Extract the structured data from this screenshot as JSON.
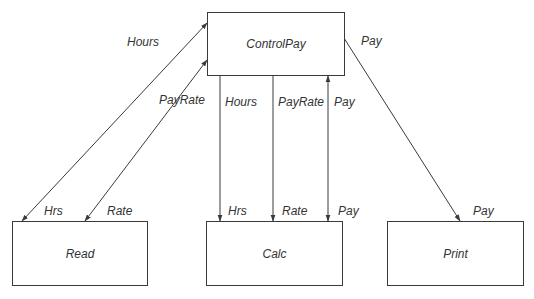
{
  "nodes": {
    "controlpay": {
      "label": "ControlPay"
    },
    "read": {
      "label": "Read"
    },
    "calc": {
      "label": "Calc"
    },
    "print": {
      "label": "Print"
    }
  },
  "edges": [
    {
      "from": "ControlPay",
      "to": "Read",
      "direction": "bidirectional",
      "label_top": "Hours",
      "label_bottom": "Hrs"
    },
    {
      "from": "ControlPay",
      "to": "Read",
      "direction": "bidirectional",
      "label_top": "PayRate",
      "label_bottom": "Rate"
    },
    {
      "from": "ControlPay",
      "to": "Calc",
      "direction": "down",
      "label_top": "Hours",
      "label_bottom": "Hrs"
    },
    {
      "from": "ControlPay",
      "to": "Calc",
      "direction": "down",
      "label_top": "PayRate",
      "label_bottom": "Rate"
    },
    {
      "from": "ControlPay",
      "to": "Calc",
      "direction": "bidirectional",
      "label_top": "Pay",
      "label_bottom": "Pay"
    },
    {
      "from": "ControlPay",
      "to": "Print",
      "direction": "down",
      "label_top": "Pay",
      "label_bottom": "Pay"
    }
  ],
  "colors": {
    "line": "#3a3a3a",
    "text": "#333333",
    "background": "#ffffff"
  }
}
